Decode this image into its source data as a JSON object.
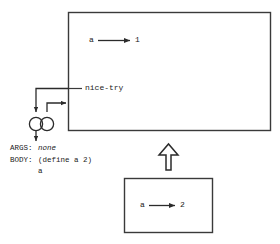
{
  "diagram": {
    "line_color": "#3a3a3a",
    "text_color": "#1a1a1a",
    "global_frame": {
      "bindings": [
        {
          "name": "a",
          "arrow": "→",
          "value": "1"
        },
        {
          "name": "nice-try",
          "arrow": "",
          "value": ""
        }
      ],
      "binding_a_name": "a",
      "binding_a_value": "1",
      "procedure_label": "nice-try"
    },
    "procedure_object": {
      "args_key": "ARGS:",
      "args_value": "none",
      "body_key": "BODY:",
      "body_value": "(define a 2)",
      "body_value_2": "a"
    },
    "inner_frame": {
      "binding_name": "a",
      "binding_value": "2"
    },
    "enclosing_pointer": "hollow-up-arrow"
  }
}
